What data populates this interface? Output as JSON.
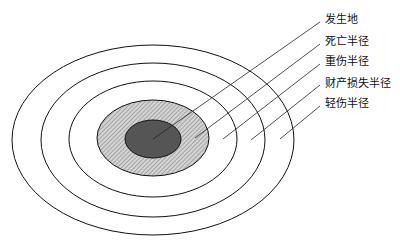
{
  "diagram": {
    "type": "concentric-zones",
    "center": [
      153,
      139
    ],
    "zones": [
      {
        "name": "light-injury-zone",
        "rx": 141,
        "ry": 95,
        "fill": "none"
      },
      {
        "name": "property-loss-zone",
        "rx": 112,
        "ry": 77,
        "fill": "none"
      },
      {
        "name": "serious-injury-zone",
        "rx": 84,
        "ry": 58,
        "fill": "none"
      },
      {
        "name": "death-zone",
        "rx": 56,
        "ry": 38,
        "fill": "hatched"
      },
      {
        "name": "origin-zone",
        "rx": 28,
        "ry": 19,
        "fill": "#555555"
      }
    ],
    "labels": [
      {
        "text": "发生地",
        "x": 325,
        "y": 14
      },
      {
        "text": "死亡半径",
        "x": 325,
        "y": 36
      },
      {
        "text": "重伤半径",
        "x": 325,
        "y": 56
      },
      {
        "text": "财产损失半径",
        "x": 325,
        "y": 78
      },
      {
        "text": "轻伤半径",
        "x": 325,
        "y": 98
      }
    ]
  }
}
